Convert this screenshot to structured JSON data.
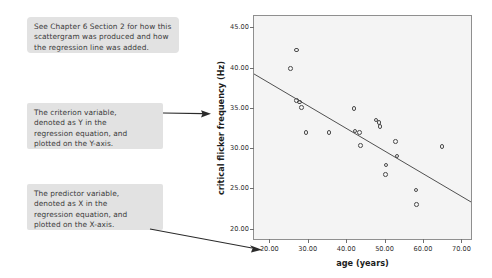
{
  "figure": {
    "kind": "annotated-scatterplot-figure"
  },
  "callouts": [
    {
      "id": "chapter-note",
      "lines": [
        "See Chapter 6 Section 2 for how this",
        "scattergram was produced and how",
        "the regression line was added."
      ]
    },
    {
      "id": "criterion-note",
      "lines": [
        "The criterion variable,",
        "denoted as Y in the",
        "regression equation, and",
        "plotted on the Y-axis."
      ]
    },
    {
      "id": "predictor-note",
      "lines": [
        "The predictor variable,",
        "denoted as X in the",
        "regression equation, and",
        "plotted on the X-axis."
      ]
    }
  ],
  "chart_data": {
    "type": "scatter",
    "title": "",
    "xlabel": "age (years)",
    "ylabel": "critical flicker frequency (Hz)",
    "xlim": [
      16.0,
      72.5
    ],
    "ylim": [
      18.7,
      46.4
    ],
    "xticks": [
      20.0,
      30.0,
      40.0,
      50.0,
      60.0,
      70.0
    ],
    "xticklabels": [
      "20.00",
      "30.00",
      "40.00",
      "50.00",
      "60.00",
      "70.00"
    ],
    "yticks": [
      20.0,
      25.0,
      30.0,
      35.0,
      40.0,
      45.0
    ],
    "yticklabels": [
      "20.00",
      "25.00",
      "30.00",
      "35.00",
      "40.00",
      "45.00"
    ],
    "grid": false,
    "legend": null,
    "marker": "open-circle",
    "points": [
      {
        "x": 27.0,
        "y": 42.2
      },
      {
        "x": 25.5,
        "y": 39.9
      },
      {
        "x": 27.0,
        "y": 35.9
      },
      {
        "x": 27.8,
        "y": 35.7
      },
      {
        "x": 28.3,
        "y": 35.0
      },
      {
        "x": 29.5,
        "y": 31.9
      },
      {
        "x": 35.5,
        "y": 31.9
      },
      {
        "x": 42.0,
        "y": 34.9
      },
      {
        "x": 42.3,
        "y": 32.1
      },
      {
        "x": 43.5,
        "y": 31.9
      },
      {
        "x": 43.7,
        "y": 30.3
      },
      {
        "x": 47.8,
        "y": 33.5
      },
      {
        "x": 48.5,
        "y": 33.2
      },
      {
        "x": 48.8,
        "y": 32.7
      },
      {
        "x": 50.2,
        "y": 26.7
      },
      {
        "x": 50.4,
        "y": 27.9
      },
      {
        "x": 52.8,
        "y": 30.8
      },
      {
        "x": 53.2,
        "y": 29.0
      },
      {
        "x": 58.2,
        "y": 24.8
      },
      {
        "x": 58.3,
        "y": 23.0
      },
      {
        "x": 65.0,
        "y": 30.2
      }
    ],
    "regression_line": {
      "x_start": 16.0,
      "y_start": 39.2,
      "x_end": 72.5,
      "y_end": 23.3
    }
  },
  "icons": {
    "arrow_criterion": "arrow-right-icon",
    "arrow_predictor": "arrow-down-right-icon"
  },
  "colors": {
    "callout_bg": "#e2e2e2",
    "plot_bg": "#f4f4f4",
    "frame": "#8f8f8f",
    "marker": "#4a4a4a",
    "line": "#3d3d3d",
    "text": "#1d1d1d"
  }
}
